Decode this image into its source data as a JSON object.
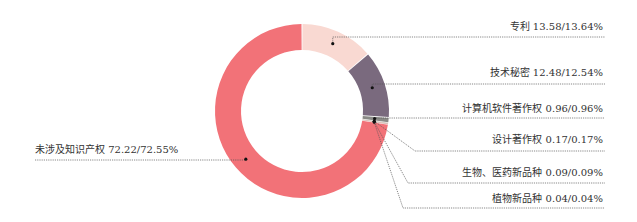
{
  "chart_data": {
    "type": "pie",
    "variant": "donut",
    "title": "",
    "start": "top",
    "direction": "clockwise",
    "slices": [
      {
        "name": "专利",
        "value": 13.58,
        "value2": 13.64,
        "label": "专利 13.58/13.64%",
        "color": "#f9d9d2",
        "label_side": "right"
      },
      {
        "name": "技术秘密",
        "value": 12.48,
        "value2": 12.54,
        "label": "技术秘密 12.48/12.54%",
        "color": "#7a6a7e",
        "label_side": "right"
      },
      {
        "name": "计算机软件著作权",
        "value": 0.96,
        "value2": 0.96,
        "label": "计算机软件著作权 0.96/0.96%",
        "color": "#8a8a86",
        "label_side": "right"
      },
      {
        "name": "设计著作权",
        "value": 0.17,
        "value2": 0.17,
        "label": "设计著作权 0.17/0.17%",
        "color": "#c9c4b8",
        "label_side": "right"
      },
      {
        "name": "生物、医药新品种",
        "value": 0.09,
        "value2": 0.09,
        "label": "生物、医药新品种 0.09/0.09%",
        "color": "#d8a8a0",
        "label_side": "right"
      },
      {
        "name": "植物新品种",
        "value": 0.04,
        "value2": 0.04,
        "label": "植物新品种 0.04/0.04%",
        "color": "#b08a8a",
        "label_side": "right"
      },
      {
        "name": "未涉及知识产权",
        "value": 72.22,
        "value2": 72.55,
        "label": "未涉及知识产权 72.22/72.55%",
        "color": "#f27278",
        "label_side": "left"
      }
    ]
  }
}
